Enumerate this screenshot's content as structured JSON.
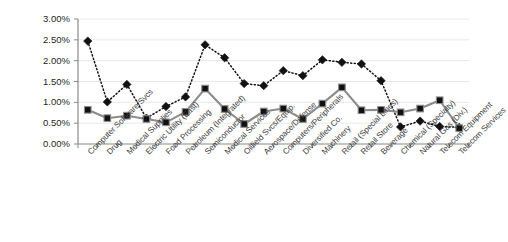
{
  "chart_data": {
    "type": "line",
    "title": "",
    "xlabel": "",
    "ylabel": "",
    "ylim": [
      0,
      0.03
    ],
    "grid": true,
    "legend": "none",
    "y_tick_labels": [
      "3.00%",
      "2.50%",
      "2.00%",
      "1.50%",
      "1.00%",
      "0.50%",
      "0.00%"
    ],
    "y_tick_values": [
      0.03,
      0.025,
      0.02,
      0.015,
      0.01,
      0.005,
      0
    ],
    "categories": [
      "Computer Software/Svcs",
      "Drug",
      "Medical Supplies",
      "Electric Utility (East)",
      "Food Processing",
      "Petroleum (Integrated)",
      "Semiconductor",
      "Medical Services",
      "Oilfield Svcs/Equip.",
      "Aerospace/Defense",
      "Computers/Peripherals",
      "Diversified Co.",
      "Machinery",
      "Retail (Special Lines)",
      "Retail Store",
      "Beverage",
      "Chemical (Specialty)",
      "Natural Gas (Div.)",
      "Telecom Equipment",
      "Telecom Services"
    ],
    "series": [
      {
        "name": "dotted-diamond-series",
        "marker": "diamond",
        "line_style": "dotted",
        "color": "#111111",
        "values": [
          0.0247,
          0.0101,
          0.0143,
          0.0062,
          0.009,
          0.0113,
          0.0238,
          0.0207,
          0.0145,
          0.014,
          0.0176,
          0.0164,
          0.0202,
          0.0196,
          0.0192,
          0.0152,
          0.0041,
          0.0055,
          0.0042,
          0.004
        ]
      },
      {
        "name": "solid-square-series",
        "marker": "square",
        "line_style": "solid",
        "color": "#8c8c8c",
        "values": [
          0.0082,
          0.0062,
          0.0068,
          0.006,
          0.0052,
          0.0077,
          0.0133,
          0.0084,
          0.0048,
          0.0078,
          0.0085,
          0.006,
          0.0097,
          0.0136,
          0.0081,
          0.0082,
          0.0076,
          0.0085,
          0.0105,
          0.0038
        ]
      }
    ]
  }
}
